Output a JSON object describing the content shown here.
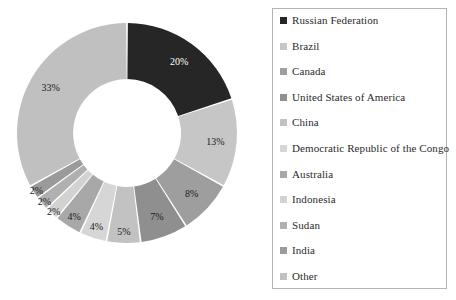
{
  "chart_data": {
    "type": "pie",
    "variant": "donut",
    "title": "",
    "subtitle": "",
    "xlabel": "",
    "ylabel": "",
    "start_angle_deg": 0,
    "direction": "clockwise",
    "inner_radius_ratio": 0.49,
    "value_unit": "percent",
    "legend_position": "right",
    "grid": false,
    "categories": [
      "Russian Federation",
      "Brazil",
      "Canada",
      "United States of America",
      "China",
      "Democratic Republic of the Congo",
      "Australia",
      "Indonesia",
      "Sudan",
      "India",
      "Other"
    ],
    "values": [
      20,
      13,
      8,
      7,
      5,
      4,
      4,
      2,
      2,
      2,
      33
    ],
    "data_labels": [
      "20%",
      "13%",
      "8%",
      "7%",
      "5%",
      "4%",
      "4%",
      "2%",
      "2%",
      "2%",
      "33%"
    ],
    "colors": [
      "#262626",
      "#c6c6c6",
      "#9e9e9e",
      "#8f8f8f",
      "#c2c2c2",
      "#d6d6d6",
      "#a8a8a8",
      "#d2d2d2",
      "#b0b0b0",
      "#9a9a9a",
      "#c0c0c0"
    ]
  },
  "legend": {
    "items": [
      {
        "label": "Russian Federation",
        "color": "#262626"
      },
      {
        "label": "Brazil",
        "color": "#c6c6c6"
      },
      {
        "label": "Canada",
        "color": "#9e9e9e"
      },
      {
        "label": "United States of America",
        "color": "#8f8f8f"
      },
      {
        "label": "China",
        "color": "#c2c2c2"
      },
      {
        "label": "Democratic Republic of the Congo",
        "color": "#d6d6d6"
      },
      {
        "label": "Australia",
        "color": "#a8a8a8"
      },
      {
        "label": "Indonesia",
        "color": "#d2d2d2"
      },
      {
        "label": "Sudan",
        "color": "#b0b0b0"
      },
      {
        "label": "India",
        "color": "#9a9a9a"
      },
      {
        "label": "Other",
        "color": "#c0c0c0"
      }
    ]
  }
}
